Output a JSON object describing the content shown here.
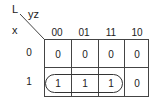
{
  "kmap": {
    "function_label": "L",
    "column_variables": "yz",
    "row_variables": "x",
    "column_headers": [
      "00",
      "01",
      "11",
      "10"
    ],
    "row_headers": [
      "0",
      "1"
    ],
    "cells": [
      [
        "0",
        "0",
        "0",
        "0"
      ],
      [
        "1",
        "1",
        "1",
        "0"
      ]
    ],
    "groups": [
      {
        "row": 1,
        "columns": [
          0,
          1,
          2
        ],
        "label": "x y' + x z grouping (cells 100, 101, 111)"
      }
    ]
  }
}
